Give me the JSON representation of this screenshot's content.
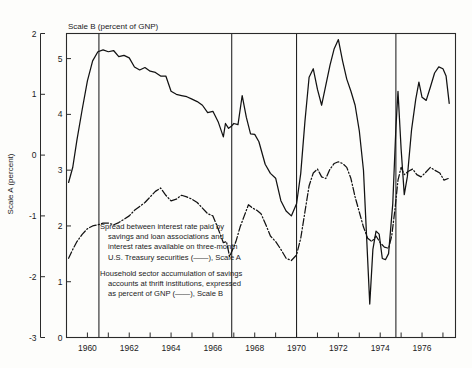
{
  "chart_data": {
    "type": "line",
    "title": "",
    "subtitle": "",
    "top_axis_title": "Scale B (percent of GNP)",
    "ylabel": "Scale A (percent)",
    "xlabel": "",
    "grid": false,
    "legend_position": "inside-lower-left",
    "x": {
      "label": "",
      "range": [
        1959.0,
        1977.6
      ],
      "tick_step": 1,
      "ticks": [
        1959,
        1960,
        1961,
        1962,
        1963,
        1964,
        1965,
        1966,
        1967,
        1968,
        1969,
        1970,
        1971,
        1972,
        1973,
        1974,
        1975,
        1976,
        1977
      ],
      "tick_labels": [
        "",
        "1960",
        "",
        "1962",
        "",
        "1964",
        "",
        "1966",
        "",
        "1968",
        "",
        "1970",
        "",
        "1972",
        "",
        "1974",
        "",
        "1976",
        ""
      ]
    },
    "y_left": {
      "name": "Scale A",
      "label": "Scale A (percent)",
      "range": [
        -3,
        2
      ],
      "ticks": [
        -3,
        -2,
        -1,
        0,
        1,
        2
      ],
      "tick_labels": [
        "-3",
        "-2",
        "-1",
        "0",
        "1",
        "2"
      ]
    },
    "y_right_inner": {
      "name": "Scale B",
      "label": "Scale B (percent of GNP)",
      "range": [
        0,
        5.45
      ],
      "ticks": [
        0,
        1,
        2,
        3,
        4,
        5
      ],
      "tick_labels": [
        "0",
        "1",
        "2",
        "3",
        "4",
        "5"
      ]
    },
    "reference_lines": {
      "description": "vertical marker lines",
      "x_values": [
        1960.55,
        1966.9,
        1970.0,
        1974.75
      ]
    },
    "series": [
      {
        "name": "Spread between interest rate paid by savings and loan associations and interest rates available on three-month U.S. Treasury securities",
        "scale": "A",
        "style": "solid",
        "points": [
          [
            1959.1,
            -0.45
          ],
          [
            1959.3,
            -0.2
          ],
          [
            1959.5,
            0.25
          ],
          [
            1959.75,
            0.75
          ],
          [
            1960.0,
            1.22
          ],
          [
            1960.25,
            1.55
          ],
          [
            1960.5,
            1.7
          ],
          [
            1960.75,
            1.73
          ],
          [
            1961.0,
            1.7
          ],
          [
            1961.25,
            1.72
          ],
          [
            1961.5,
            1.62
          ],
          [
            1961.75,
            1.64
          ],
          [
            1962.0,
            1.6
          ],
          [
            1962.25,
            1.45
          ],
          [
            1962.5,
            1.4
          ],
          [
            1962.75,
            1.44
          ],
          [
            1963.0,
            1.38
          ],
          [
            1963.25,
            1.36
          ],
          [
            1963.5,
            1.3
          ],
          [
            1963.75,
            1.3
          ],
          [
            1964.0,
            1.05
          ],
          [
            1964.25,
            1.0
          ],
          [
            1964.5,
            0.98
          ],
          [
            1964.75,
            0.96
          ],
          [
            1965.0,
            0.92
          ],
          [
            1965.25,
            0.88
          ],
          [
            1965.5,
            0.82
          ],
          [
            1965.75,
            0.7
          ],
          [
            1966.0,
            0.72
          ],
          [
            1966.25,
            0.55
          ],
          [
            1966.5,
            0.3
          ],
          [
            1966.6,
            0.52
          ],
          [
            1966.75,
            0.44
          ],
          [
            1966.9,
            0.48
          ],
          [
            1967.0,
            0.52
          ],
          [
            1967.2,
            0.5
          ],
          [
            1967.4,
            0.98
          ],
          [
            1967.6,
            0.62
          ],
          [
            1967.8,
            0.35
          ],
          [
            1968.0,
            0.34
          ],
          [
            1968.2,
            0.22
          ],
          [
            1968.5,
            -0.15
          ],
          [
            1968.75,
            -0.3
          ],
          [
            1969.0,
            -0.38
          ],
          [
            1969.25,
            -0.75
          ],
          [
            1969.5,
            -0.92
          ],
          [
            1969.75,
            -1.0
          ],
          [
            1970.0,
            -0.8
          ],
          [
            1970.2,
            -0.3
          ],
          [
            1970.4,
            0.55
          ],
          [
            1970.6,
            1.28
          ],
          [
            1970.8,
            1.42
          ],
          [
            1971.0,
            1.08
          ],
          [
            1971.2,
            0.82
          ],
          [
            1971.4,
            1.15
          ],
          [
            1971.6,
            1.48
          ],
          [
            1971.8,
            1.75
          ],
          [
            1972.0,
            1.9
          ],
          [
            1972.2,
            1.55
          ],
          [
            1972.4,
            1.25
          ],
          [
            1972.6,
            1.05
          ],
          [
            1972.8,
            0.82
          ],
          [
            1973.0,
            0.4
          ],
          [
            1973.2,
            -0.25
          ],
          [
            1973.35,
            -1.35
          ],
          [
            1973.5,
            -2.45
          ],
          [
            1973.65,
            -1.55
          ],
          [
            1973.8,
            -1.25
          ],
          [
            1973.95,
            -1.3
          ],
          [
            1974.1,
            -1.7
          ],
          [
            1974.25,
            -1.72
          ],
          [
            1974.4,
            -1.62
          ],
          [
            1974.6,
            -0.8
          ],
          [
            1974.75,
            0.45
          ],
          [
            1974.85,
            1.05
          ],
          [
            1975.0,
            0.1
          ],
          [
            1975.15,
            -0.65
          ],
          [
            1975.3,
            -0.35
          ],
          [
            1975.5,
            0.42
          ],
          [
            1975.7,
            0.92
          ],
          [
            1975.85,
            1.2
          ],
          [
            1976.0,
            0.95
          ],
          [
            1976.2,
            0.9
          ],
          [
            1976.4,
            1.12
          ],
          [
            1976.6,
            1.35
          ],
          [
            1976.8,
            1.45
          ],
          [
            1977.0,
            1.42
          ],
          [
            1977.15,
            1.3
          ],
          [
            1977.3,
            0.85
          ]
        ]
      },
      {
        "name": "Household sector accumulation of savings accounts at thrift institutions, expressed as percent of GNP",
        "scale": "B",
        "style": "dash-dot",
        "points": [
          [
            1959.1,
            1.42
          ],
          [
            1959.3,
            1.58
          ],
          [
            1959.5,
            1.72
          ],
          [
            1959.75,
            1.85
          ],
          [
            1960.0,
            1.95
          ],
          [
            1960.25,
            2.0
          ],
          [
            1960.5,
            2.02
          ],
          [
            1960.75,
            2.05
          ],
          [
            1961.0,
            2.05
          ],
          [
            1961.25,
            2.02
          ],
          [
            1961.5,
            2.06
          ],
          [
            1961.75,
            2.12
          ],
          [
            1962.0,
            2.18
          ],
          [
            1962.25,
            2.28
          ],
          [
            1962.5,
            2.35
          ],
          [
            1962.75,
            2.42
          ],
          [
            1963.0,
            2.52
          ],
          [
            1963.25,
            2.62
          ],
          [
            1963.5,
            2.68
          ],
          [
            1963.75,
            2.55
          ],
          [
            1964.0,
            2.45
          ],
          [
            1964.25,
            2.48
          ],
          [
            1964.5,
            2.55
          ],
          [
            1964.75,
            2.52
          ],
          [
            1965.0,
            2.48
          ],
          [
            1965.25,
            2.42
          ],
          [
            1965.5,
            2.32
          ],
          [
            1965.75,
            2.22
          ],
          [
            1966.0,
            2.18
          ],
          [
            1966.25,
            1.95
          ],
          [
            1966.5,
            1.7
          ],
          [
            1966.65,
            1.72
          ],
          [
            1966.8,
            1.45
          ],
          [
            1966.95,
            1.58
          ],
          [
            1967.1,
            1.72
          ],
          [
            1967.3,
            1.98
          ],
          [
            1967.5,
            2.18
          ],
          [
            1967.7,
            2.38
          ],
          [
            1967.9,
            2.32
          ],
          [
            1968.1,
            2.28
          ],
          [
            1968.3,
            2.22
          ],
          [
            1968.5,
            2.05
          ],
          [
            1968.75,
            1.82
          ],
          [
            1969.0,
            1.72
          ],
          [
            1969.25,
            1.58
          ],
          [
            1969.5,
            1.42
          ],
          [
            1969.75,
            1.38
          ],
          [
            1970.0,
            1.48
          ],
          [
            1970.2,
            1.78
          ],
          [
            1970.4,
            2.25
          ],
          [
            1970.6,
            2.72
          ],
          [
            1970.8,
            2.95
          ],
          [
            1971.0,
            3.02
          ],
          [
            1971.2,
            2.88
          ],
          [
            1971.4,
            2.85
          ],
          [
            1971.6,
            3.02
          ],
          [
            1971.8,
            3.12
          ],
          [
            1972.0,
            3.15
          ],
          [
            1972.2,
            3.12
          ],
          [
            1972.4,
            3.05
          ],
          [
            1972.6,
            2.85
          ],
          [
            1972.8,
            2.52
          ],
          [
            1973.0,
            2.25
          ],
          [
            1973.2,
            1.98
          ],
          [
            1973.4,
            1.78
          ],
          [
            1973.6,
            1.72
          ],
          [
            1973.8,
            1.82
          ],
          [
            1974.0,
            1.7
          ],
          [
            1974.2,
            1.62
          ],
          [
            1974.4,
            1.6
          ],
          [
            1974.55,
            1.82
          ],
          [
            1974.7,
            2.28
          ],
          [
            1974.85,
            2.82
          ],
          [
            1975.0,
            3.05
          ],
          [
            1975.15,
            2.92
          ],
          [
            1975.35,
            2.98
          ],
          [
            1975.55,
            3.02
          ],
          [
            1975.75,
            2.92
          ],
          [
            1975.95,
            2.88
          ],
          [
            1976.15,
            2.95
          ],
          [
            1976.4,
            3.05
          ],
          [
            1976.6,
            3.0
          ],
          [
            1976.85,
            2.95
          ],
          [
            1977.05,
            2.82
          ],
          [
            1977.25,
            2.85
          ]
        ]
      }
    ],
    "annotations": [
      {
        "id": "annotation-series-a",
        "lines": [
          "Spread between interest rate paid by",
          "savings and loan associations and",
          "interest rates available on three-month",
          "U.S. Treasury securities (——), Scale A"
        ]
      },
      {
        "id": "annotation-series-b",
        "lines": [
          "Household sector accumulation of savings",
          "accounts at thrift institutions, expressed",
          "as percent of GNP (——), Scale B"
        ]
      }
    ],
    "colors": {
      "line": "#121212",
      "axis": "#2a2a2a",
      "background": "#fdfdfb"
    }
  }
}
